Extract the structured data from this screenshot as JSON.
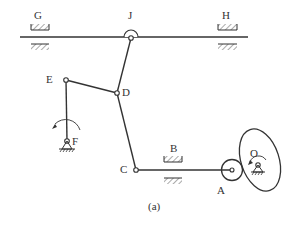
{
  "figure": {
    "caption": "(a)",
    "labels": {
      "G": "G",
      "J": "J",
      "H": "H",
      "E": "E",
      "D": "D",
      "F": "F",
      "C": "C",
      "B": "B",
      "A": "A",
      "O": "O"
    },
    "colors": {
      "stroke": "#333333",
      "background": "#ffffff"
    }
  }
}
